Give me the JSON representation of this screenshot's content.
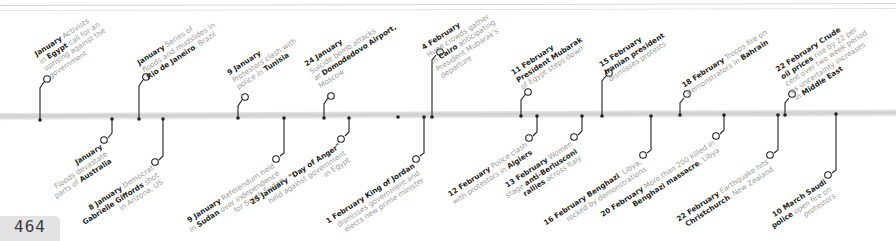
{
  "page": {
    "number": "464"
  },
  "timeline": {
    "events_above": [
      {
        "date": "January",
        "parts": [
          [
            " Activists",
            false
          ],
          [
            " in ",
            false
          ],
          [
            "Egypt",
            true
          ],
          [
            " call for an",
            false
          ],
          [
            "|uprising against the",
            false
          ],
          [
            "|government",
            false
          ]
        ],
        "lines": [
          "January Activists",
          "in Egypt call for an",
          "uprising against the",
          "government"
        ]
      },
      {
        "date": "January",
        "lines": [
          "January Series of",
          "floods and mudslides in",
          "Rio de Janeiro, Brazil"
        ]
      },
      {
        "date": "9 January",
        "lines": [
          "9 January",
          "Protestors clash with",
          "police in Tunisia"
        ]
      },
      {
        "date": "24 January",
        "lines": [
          "24 January",
          "Suicide bomb attacks",
          "at Domodedovo Airport,",
          "Moscow"
        ]
      },
      {
        "date": "4 February",
        "lines": [
          "4 February",
          "Huge crowds gather",
          "in Cairo anticipating",
          "President Mubarak's",
          "departure"
        ]
      },
      {
        "date": "11 February",
        "lines": [
          "11 February",
          "President Mubarak",
          "of Egypt steps down"
        ]
      },
      {
        "date": "15 February",
        "lines": [
          "15 February",
          "Iranian president",
          "dismisses protests"
        ]
      },
      {
        "date": "18 February",
        "lines": [
          "18 February Troops fire on",
          "demonstrators in Bahrain"
        ]
      },
      {
        "date": "22 February",
        "lines": [
          "22 February Crude",
          "oil prices rise by 22 per",
          "cent over two week period",
          "as uncertainty increases",
          "in Middle East"
        ]
      }
    ],
    "events_below": [
      {
        "date": "January",
        "lines": [
          "January",
          "Floods devastate",
          "parts of Australia"
        ]
      },
      {
        "date": "8 January",
        "lines": [
          "8 January Democrat",
          "Gabrielle Giffords shot",
          "in Arizona, US"
        ]
      },
      {
        "date": "9 January",
        "lines": [
          "9 January Referendum held",
          "in Sudan over independence",
          "for South Sudan"
        ]
      },
      {
        "date": "25 January",
        "lines": [
          "25 January \"Day of Anger\"",
          "held against government",
          "in Egypt"
        ]
      },
      {
        "date": "1 February",
        "lines": [
          "1 February King of Jordan",
          "dismisses government and",
          "elects new prime minister"
        ]
      },
      {
        "date": "12 February",
        "lines": [
          "12 February Police clash",
          "with protestors in Algiers"
        ]
      },
      {
        "date": "13 February",
        "lines": [
          "13 February Women",
          "stage anti-Berlusconi",
          "rallies across Italy"
        ]
      },
      {
        "date": "16 February",
        "lines": [
          "16 February Benghazi, Libya,",
          "rocked by demonstrations"
        ]
      },
      {
        "date": "20 February",
        "lines": [
          "20 February More than 200 killed in",
          "Benghazi massacre, Libya"
        ]
      },
      {
        "date": "22 February",
        "lines": [
          "22 February Earthquake hits",
          "Christchurch, New Zealand"
        ]
      },
      {
        "date": "10 March",
        "lines": [
          "10 March Saudi",
          "police open fire on",
          "protestors"
        ]
      }
    ]
  },
  "text": {
    "a1_date": "January",
    "a1_l1": " Activists",
    "a1_l2a": "in ",
    "a1_l2b": "Egypt",
    "a1_l2c": " call for an",
    "a1_l3": "uprising against the",
    "a1_l4": "government",
    "a2_date": "January",
    "a2_l1": " Series of",
    "a2_l2": "floods and mudslides in",
    "a2_l3b": "Rio de Janeiro",
    "a2_l3c": ", Brazil",
    "a3_date": "9 January",
    "a3_l2": "Protestors clash with",
    "a3_l3a": "police in ",
    "a3_l3b": "Tunisia",
    "a4_date": "24 January",
    "a4_l2": "Suicide bomb attacks",
    "a4_l3a": "at ",
    "a4_l3b": "Domodedovo Airport,",
    "a4_l4": "Moscow",
    "a5_date": "4 February",
    "a5_l2": "Huge crowds gather",
    "a5_l3a": "in ",
    "a5_l3b": "Cairo",
    "a5_l3c": " anticipating",
    "a5_l4": "President Mubarak's",
    "a5_l5": "departure",
    "a6_date": "11 February",
    "a6_l2": "President Mubarak",
    "a6_l3": "of Egypt steps down",
    "a7_date": "15 February",
    "a7_l2": "Iranian president",
    "a7_l3": "dismisses protests",
    "a8_date": "18 February",
    "a8_l1": " Troops fire on",
    "a8_l2a": "demonstrators in ",
    "a8_l2b": "Bahrain",
    "a9_date": "22 February",
    "a9_l1b": " Crude",
    "a9_l2a": "oil prices",
    "a9_l2b": " rise by 22 per",
    "a9_l3": "cent over two week period",
    "a9_l4": "as uncertainty increases",
    "a9_l5a": "in ",
    "a9_l5b": "Middle East",
    "b1_date": "January",
    "b1_l2": "Floods devastate",
    "b1_l3a": "parts of ",
    "b1_l3b": "Australia",
    "b2_date": "8 January",
    "b2_l1": " Democrat",
    "b2_l2a": "Gabrielle Giffords",
    "b2_l2b": " shot",
    "b2_l3": "in Arizona, US",
    "b3_date": "9 January",
    "b3_l1": " Referendum held",
    "b3_l2a": "in ",
    "b3_l2b": "Sudan",
    "b3_l2c": " over independence",
    "b3_l3": "for South Sudan",
    "b4_date": "25 January",
    "b4_l1b": " \"Day of Anger\"",
    "b4_l2": "held against government",
    "b4_l3": "in Egypt",
    "b5_date": "1 February",
    "b5_l1b": " King of Jordan",
    "b5_l2": "dismisses government and",
    "b5_l3": "elects new prime minister",
    "b6_date": "12 February",
    "b6_l1": " Police clash",
    "b6_l2a": "with protestors in ",
    "b6_l2b": "Algiers",
    "b7_date": "13 February",
    "b7_l1": " Women",
    "b7_l2a": "stage ",
    "b7_l2b": "anti-Berlusconi",
    "b7_l3a": "rallies",
    "b7_l3b": " across Italy",
    "b8_date": "16 February",
    "b8_l1b": " Benghazi",
    "b8_l1c": ", Libya,",
    "b8_l2": "rocked by demonstrations",
    "b9_date": "20 February",
    "b9_l1": " More than 200 killed in",
    "b9_l2a": "Benghazi massacre",
    "b9_l2b": ", Libya",
    "b10_date": "22 February",
    "b10_l1": " Earthquake hits",
    "b10_l2a": "Christchurch",
    "b10_l2b": ", New Zealand",
    "b11_date": "10 March",
    "b11_l1b": " Saudi",
    "b11_l2a": "police",
    "b11_l2b": " open fire on",
    "b11_l3": "protestors"
  },
  "colors": {
    "ink": "#1e1e1e",
    "muted": "#9a9a9a",
    "bar": "#d4d4d4",
    "page_tab": "#e3e3e3"
  }
}
